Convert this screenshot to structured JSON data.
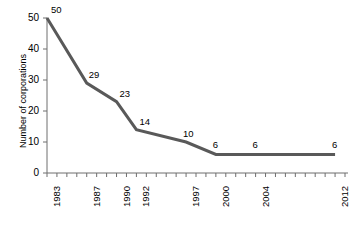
{
  "chart_data": {
    "type": "line",
    "title": "",
    "xlabel": "",
    "ylabel": "Number of corporations",
    "categories": [
      "1983",
      "1987",
      "1990",
      "1992",
      "1997",
      "2000",
      "2004",
      "2012"
    ],
    "x": [
      1983,
      1987,
      1990,
      1992,
      1997,
      2000,
      2004,
      2012
    ],
    "values": [
      50,
      29,
      23,
      14,
      10,
      6,
      6,
      6
    ],
    "point_labels": [
      "50",
      "29",
      "23",
      "14",
      "10",
      "6",
      "6",
      "6"
    ],
    "ylim": [
      0,
      50
    ],
    "xlim": [
      1983,
      2013
    ],
    "ytick_labels": [
      "0",
      "10",
      "20",
      "30",
      "40",
      "50"
    ],
    "ytick_values": [
      0,
      10,
      20,
      30,
      40,
      50
    ],
    "xtick_labels": [
      "1983",
      "1987",
      "1990",
      "1992",
      "1997",
      "2000",
      "2004",
      "2012"
    ],
    "xtick_values": [
      1983,
      1987,
      1990,
      1992,
      1997,
      2000,
      2004,
      2012
    ],
    "minor_xticks_every_year": true,
    "grid": false,
    "legend": "none",
    "line_color": "#595959",
    "line_width": 3,
    "axis_color": "#6e6e6e"
  }
}
